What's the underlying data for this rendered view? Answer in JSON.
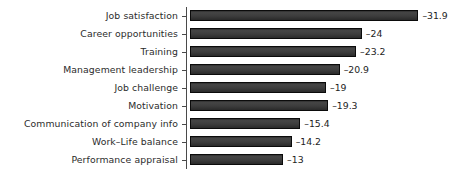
{
  "chart_data": {
    "type": "bar",
    "orientation": "horizontal",
    "title": "",
    "subtitle": "",
    "xlabel": "",
    "ylabel": "",
    "grid": false,
    "legend": null,
    "xlim": [
      -34,
      0
    ],
    "axis": {
      "value_axis_visible": false,
      "category_axis_visible": true,
      "tick_marks": true
    },
    "categories": [
      "Job satisfaction",
      "Career opportunities",
      "Training",
      "Management leadership",
      "Job challenge",
      "Motivation",
      "Communication of company info",
      "Work–Life balance",
      "Performance appraisal"
    ],
    "values": [
      -31.9,
      -24,
      -23.2,
      -20.9,
      -19,
      -19.3,
      -15.4,
      -14.2,
      -13
    ],
    "data_labels": [
      "–31.9",
      "–24",
      "–23.2",
      "–20.9",
      "–19",
      "–19.3",
      "–15.4",
      "–14.2",
      "–13"
    ],
    "bar_color": "#3d3d3d",
    "bar_outline_color": "#0b0b0b",
    "text_color": "#2b2b2b",
    "background_color": "#ffffff"
  }
}
